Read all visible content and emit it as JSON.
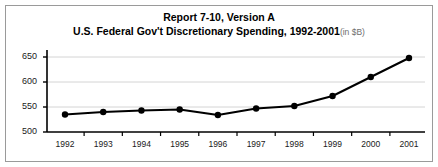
{
  "title": {
    "line1": "Report 7-10, Version A",
    "line2": "U.S. Federal Gov't Discretionary Spending, 1992-2001",
    "unit_note": "(in $B)"
  },
  "colors": {
    "series": "#000000",
    "gridline": "#d4d4d4",
    "axis": "#000000",
    "border": "#9a9a9a",
    "background": "#ffffff",
    "unit_text": "#6e6e6e"
  },
  "chart_data": {
    "type": "line",
    "xlabel": "",
    "ylabel": "",
    "categories": [
      "1992",
      "1993",
      "1994",
      "1995",
      "1996",
      "1997",
      "1998",
      "1999",
      "2000",
      "2001"
    ],
    "x": [
      1992,
      1993,
      1994,
      1995,
      1996,
      1997,
      1998,
      1999,
      2000,
      2001
    ],
    "values": [
      535,
      540,
      543,
      545,
      534,
      547,
      552,
      572,
      610,
      648
    ],
    "series": [
      {
        "name": "U.S. Federal Gov't Discretionary Spending",
        "values": [
          535,
          540,
          543,
          545,
          534,
          547,
          552,
          572,
          610,
          648
        ]
      }
    ],
    "yticks": [
      500,
      550,
      600,
      650
    ],
    "ytick_labels": [
      "500",
      "550",
      "600",
      "650"
    ],
    "ylim": [
      500,
      662
    ],
    "xlim": [
      1991.6,
      2001.4
    ],
    "grid": true,
    "grid_axis": "y",
    "legend": false,
    "markers": true,
    "marker_style": "filled-circle",
    "units": "$B"
  }
}
